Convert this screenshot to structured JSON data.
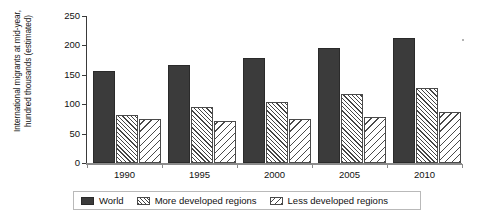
{
  "chart_data": {
    "type": "bar",
    "title": "",
    "xlabel": "",
    "ylabel": "International migrants at mid-year, hundred thousands (estimated)",
    "ylabel_lines": [
      "International migrants at mid-year,",
      "hundred thousands (estimated)"
    ],
    "categories": [
      "1990",
      "1995",
      "2000",
      "2005",
      "2010"
    ],
    "series": [
      {
        "name": "World",
        "values": [
          156,
          166,
          179,
          195,
          212
        ]
      },
      {
        "name": "More developed regions",
        "values": [
          82,
          95,
          104,
          117,
          128
        ]
      },
      {
        "name": "Less developed regions",
        "values": [
          75,
          72,
          75,
          79,
          87
        ]
      }
    ],
    "ylim": [
      0,
      250
    ],
    "ytick_values": [
      0,
      50,
      100,
      150,
      200,
      250
    ],
    "ytick_labels": [
      "0",
      "50",
      "100",
      "150",
      "200",
      "250"
    ],
    "grid": false,
    "legend_position": "bottom"
  },
  "legend": {
    "items": [
      {
        "label": "World",
        "swatch": "solid-dark-square-icon",
        "color": "#3b3b3b"
      },
      {
        "label": "More developed regions",
        "swatch": "dense-hatch-square-icon",
        "color": "#444444"
      },
      {
        "label": "Less developed regions",
        "swatch": "diagonal-hatch-square-icon",
        "color": "#4a4a4a"
      }
    ]
  }
}
